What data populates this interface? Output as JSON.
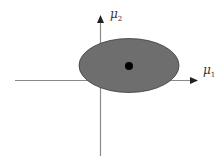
{
  "diagram": {
    "axes": {
      "x_label": "μ",
      "x_label_sub": "1",
      "y_label": "μ",
      "y_label_sub": "2"
    },
    "region": {
      "shape": "ellipse",
      "fill": "#6e6e6e",
      "stroke": "#333333"
    },
    "point": {
      "fill": "#000000"
    },
    "colors": {
      "axis": "#888888",
      "arrow": "#222222"
    }
  }
}
